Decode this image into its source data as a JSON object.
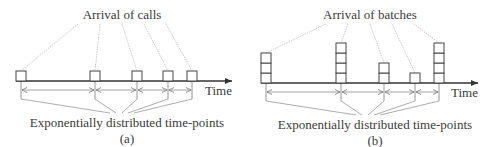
{
  "panels": [
    {
      "id": "a",
      "title": "Arrival of calls",
      "axis_label": "Time",
      "bottom_label": "Exponentially distributed time-points",
      "caption": "(a)",
      "axis": {
        "x1": 16,
        "x2": 232,
        "y": 81
      },
      "arrivals": [
        {
          "x": 21,
          "count": 1
        },
        {
          "x": 95,
          "count": 1
        },
        {
          "x": 137,
          "count": 1
        },
        {
          "x": 168,
          "count": 1
        },
        {
          "x": 192,
          "count": 1
        }
      ],
      "title_pos": {
        "x": 122,
        "y": 19
      },
      "time_pos": {
        "x": 205,
        "y": 95
      },
      "bottom_pos": {
        "x": 127,
        "y": 127
      },
      "caption_pos": {
        "x": 127,
        "y": 143
      },
      "bottom_anchor": {
        "x": 122,
        "y": 113
      }
    },
    {
      "id": "b",
      "title": "Arrival of batches",
      "axis_label": "Time",
      "bottom_label": "Exponentially distributed time-points",
      "caption": "(b)",
      "axis": {
        "x1": 261,
        "x2": 478,
        "y": 83
      },
      "arrivals": [
        {
          "x": 266,
          "count": 3
        },
        {
          "x": 341,
          "count": 4
        },
        {
          "x": 384,
          "count": 2
        },
        {
          "x": 415,
          "count": 1
        },
        {
          "x": 439,
          "count": 4
        }
      ],
      "title_pos": {
        "x": 370,
        "y": 19
      },
      "time_pos": {
        "x": 451,
        "y": 97
      },
      "bottom_pos": {
        "x": 375,
        "y": 129
      },
      "caption_pos": {
        "x": 375,
        "y": 145
      },
      "bottom_anchor": {
        "x": 368,
        "y": 115
      }
    }
  ],
  "colors": {
    "line": "#333333",
    "leader": "#bdbdbd",
    "interval": "#8a8a8a",
    "box": "#444444"
  }
}
